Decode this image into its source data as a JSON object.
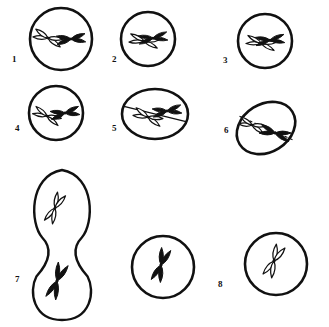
{
  "figure": {
    "background_color": "#ffffff",
    "ink_color": "#111111",
    "outline_chromosome_fill": "#ffffff",
    "solid_chromosome_fill": "#111111",
    "width": 329,
    "height": 327
  },
  "labels": [
    {
      "text": "1",
      "x": 12,
      "y": 55
    },
    {
      "text": "2",
      "x": 112,
      "y": 55
    },
    {
      "text": "3",
      "x": 223,
      "y": 56
    },
    {
      "text": "4",
      "x": 15,
      "y": 124
    },
    {
      "text": "5",
      "x": 112,
      "y": 124
    },
    {
      "text": "6",
      "x": 224,
      "y": 126
    },
    {
      "text": "7",
      "x": 15,
      "y": 275
    },
    {
      "text": "8",
      "x": 218,
      "y": 280
    }
  ],
  "cells": [
    {
      "id": "cell-1",
      "label": "1",
      "shape": "circle",
      "cx": 61,
      "cy": 39,
      "rx": 31,
      "ry": 31,
      "rotate": 0,
      "plate": "none",
      "chromosomes": [
        {
          "style": "outline",
          "cx": 48,
          "cy": 38,
          "angle": 20,
          "len": 30,
          "width": 9
        },
        {
          "style": "solid",
          "cx": 71,
          "cy": 39,
          "angle": -5,
          "len": 30,
          "width": 9
        }
      ]
    },
    {
      "id": "cell-2",
      "label": "2",
      "shape": "circle",
      "cx": 148,
      "cy": 39,
      "rx": 27,
      "ry": 27,
      "rotate": 0,
      "plate": "none",
      "chromosomes": [
        {
          "style": "outline",
          "cx": 144,
          "cy": 41,
          "angle": 12,
          "len": 30,
          "width": 8
        },
        {
          "style": "solid",
          "cx": 153,
          "cy": 38,
          "angle": -8,
          "len": 30,
          "width": 8
        }
      ]
    },
    {
      "id": "cell-3",
      "label": "3",
      "shape": "circle",
      "cx": 265,
      "cy": 41,
      "rx": 27,
      "ry": 27,
      "rotate": 0,
      "plate": "none",
      "chromosomes": [
        {
          "style": "outline",
          "cx": 261,
          "cy": 43,
          "angle": 14,
          "len": 30,
          "width": 8
        },
        {
          "style": "solid",
          "cx": 270,
          "cy": 40,
          "angle": -6,
          "len": 30,
          "width": 8
        }
      ]
    },
    {
      "id": "cell-4",
      "label": "4",
      "shape": "circle",
      "cx": 56,
      "cy": 113,
      "rx": 27,
      "ry": 27,
      "rotate": 0,
      "plate": "none",
      "chromosomes": [
        {
          "style": "outline",
          "cx": 47,
          "cy": 116,
          "angle": 25,
          "len": 29,
          "width": 8
        },
        {
          "style": "solid",
          "cx": 65,
          "cy": 113,
          "angle": -10,
          "len": 30,
          "width": 9
        }
      ]
    },
    {
      "id": "cell-5",
      "label": "5",
      "shape": "ellipse",
      "cx": 155,
      "cy": 114,
      "rx": 33,
      "ry": 25,
      "rotate": 0,
      "plate": "solid",
      "plate_angle": 14,
      "plate_len": 66,
      "chromosomes": [
        {
          "style": "outline",
          "cx": 148,
          "cy": 117,
          "angle": 22,
          "len": 30,
          "width": 9
        },
        {
          "style": "solid",
          "cx": 167,
          "cy": 111,
          "angle": -8,
          "len": 30,
          "width": 9
        }
      ]
    },
    {
      "id": "cell-6",
      "label": "6",
      "shape": "ellipse",
      "cx": 266,
      "cy": 128,
      "rx": 31,
      "ry": 24,
      "rotate": -32,
      "plate": "dashed",
      "plate_angle": 24,
      "plate_len": 58,
      "chromosomes": [
        {
          "style": "outline",
          "cx": 252,
          "cy": 125,
          "angle": 20,
          "len": 27,
          "width": 8
        },
        {
          "style": "solid",
          "cx": 275,
          "cy": 133,
          "angle": 16,
          "len": 32,
          "width": 9
        }
      ]
    },
    {
      "id": "cell-7",
      "label": "7",
      "shape": "dividing",
      "cx": 62,
      "cy": 245,
      "rx": 32,
      "ry": 75,
      "rotate": 0,
      "plate": "none",
      "chromosomes": [
        {
          "style": "outline",
          "cx": 55,
          "cy": 208,
          "angle": 115,
          "len": 32,
          "width": 9
        },
        {
          "style": "solid",
          "cx": 57,
          "cy": 281,
          "angle": 110,
          "len": 38,
          "width": 10
        }
      ]
    },
    {
      "id": "cell-8",
      "label": "8",
      "shape": "circle",
      "cx": 163,
      "cy": 267,
      "rx": 31,
      "ry": 31,
      "rotate": 0,
      "plate": "none",
      "chromosomes": [
        {
          "style": "solid",
          "cx": 161,
          "cy": 265,
          "angle": 108,
          "len": 35,
          "width": 10
        }
      ]
    },
    {
      "id": "cell-9",
      "label": "",
      "shape": "circle",
      "cx": 276,
      "cy": 264,
      "rx": 31,
      "ry": 31,
      "rotate": 0,
      "plate": "none",
      "chromosomes": [
        {
          "style": "outline",
          "cx": 274,
          "cy": 261,
          "angle": 114,
          "len": 34,
          "width": 10
        }
      ]
    }
  ]
}
